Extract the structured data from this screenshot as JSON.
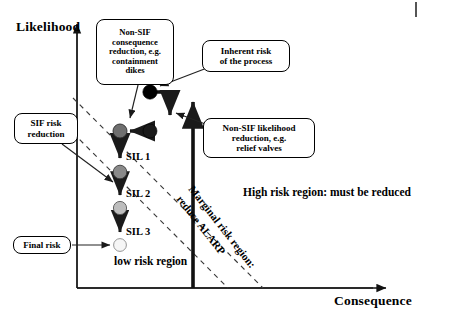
{
  "figure": {
    "type": "risk-reduction-diagram",
    "axes": {
      "y_label": "Likelihood",
      "x_label": "Consequence"
    },
    "regions": [
      {
        "id": "low",
        "text": "low risk region"
      },
      {
        "id": "high",
        "line1": "High risk region:",
        "line2": "must be reduced"
      },
      {
        "id": "marginal",
        "line1": "Marginal risk region:",
        "line2": "reduce ALARP"
      }
    ],
    "callouts": {
      "non_sif_consequence": {
        "l1": "Non-SIF",
        "l2": "consequence",
        "l3": "reduction, e.g.",
        "l4": "containment",
        "l5": "dikes"
      },
      "inherent_risk": {
        "l1": "Inherent risk",
        "l2": "of the process"
      },
      "non_sif_likelihood": {
        "l1": "Non-SIF likelihood",
        "l2": "reduction, e.g.",
        "l3": "relief valves"
      },
      "sif_risk": {
        "l1": "SIF risk",
        "l2": "reduction"
      },
      "final_risk": {
        "l1": "Final risk"
      }
    },
    "sil_labels": [
      {
        "id": "sil1",
        "text": "SIL 1"
      },
      {
        "id": "sil2",
        "text": "SIL 2"
      },
      {
        "id": "sil3",
        "text": "SIL 3"
      }
    ],
    "nodes": [
      {
        "id": "inherent-risk-node",
        "cx": 150,
        "cy": 92,
        "r": 7.2,
        "color": "#000000"
      },
      {
        "id": "post-consequence-node",
        "cx": 150,
        "cy": 131,
        "r": 7.0,
        "color": "#1a1a1a"
      },
      {
        "id": "sil0-node",
        "cx": 120,
        "cy": 131,
        "r": 7.0,
        "color": "#6f6f6f"
      },
      {
        "id": "sil1-node",
        "cx": 120,
        "cy": 172,
        "r": 6.8,
        "color": "#8a8a8a"
      },
      {
        "id": "sil2-node",
        "cx": 120,
        "cy": 208,
        "r": 6.6,
        "color": "#bdbdbd"
      },
      {
        "id": "sil3-node",
        "cx": 120,
        "cy": 245,
        "r": 6.4,
        "color": "#f2f2f2"
      }
    ],
    "colors": {
      "ink": "#000000",
      "dashed_guide": "#3a3a3a",
      "frame": "#4d4d4d"
    }
  }
}
